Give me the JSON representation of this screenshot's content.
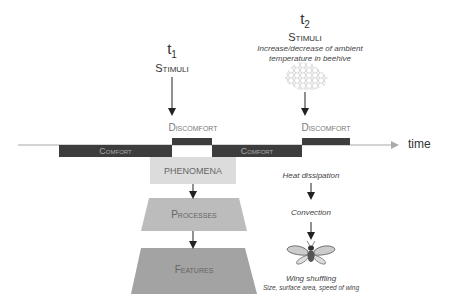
{
  "diagram": {
    "stimulus_1": {
      "time_label": "t",
      "time_sub": "1",
      "label": "Stimuli"
    },
    "stimulus_2": {
      "time_label": "t",
      "time_sub": "2",
      "label": "Stimuli",
      "description_line1": "Increase/decrease of ambient",
      "description_line2": "temperature in beehive",
      "icon": "honeycomb-icon"
    },
    "timeline": {
      "axis_label": "time",
      "segments": [
        {
          "state": "comfort",
          "label": "Comfort"
        },
        {
          "state": "discomfort",
          "label": "Discomfort"
        },
        {
          "state": "comfort",
          "label": "Comfort"
        },
        {
          "state": "discomfort",
          "label": "Discomfort"
        }
      ]
    },
    "pyramid": {
      "levels": [
        {
          "label": "PHENOMENA"
        },
        {
          "label": "Processes"
        },
        {
          "label": "Features"
        }
      ]
    },
    "example_chain": {
      "phenomenon": "Heat dissipation",
      "process": "Convection",
      "feature": "Wing shuffling",
      "feature_detail": "Size, surface area, speed of wing",
      "icon": "bee-icon"
    },
    "colors": {
      "bar_dark": "#3d3d3d",
      "axis": "#a8a8a8",
      "phenomena_fill": "#dcdcdc",
      "processes_fill": "#bcbcbc",
      "features_fill": "#a3a3a3",
      "text_gray": "#7a7a7a"
    }
  }
}
